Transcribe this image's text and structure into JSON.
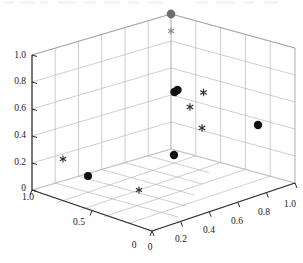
{
  "chart_data": {
    "type": "scatter",
    "title": "",
    "subtitle": "",
    "xlabel": "",
    "ylabel": "",
    "zlabel": "",
    "projection": "3d",
    "grid": true,
    "legend": "none",
    "axes": {
      "x": {
        "label": "",
        "lim": [
          1.0,
          0
        ],
        "ticks": [
          1.0,
          0.5,
          0
        ],
        "tick_labels": [
          "1.0",
          "0.5",
          "0"
        ],
        "direction": "left-front-to-back"
      },
      "y": {
        "label": "",
        "lim": [
          0,
          1.0
        ],
        "ticks": [
          0,
          0.2,
          0.4,
          0.6,
          0.8,
          1.0
        ],
        "tick_labels": [
          "0",
          "0.2",
          "0.4",
          "0.6",
          "0.8",
          "1.0"
        ],
        "direction": "right-front-to-back"
      },
      "z": {
        "label": "",
        "lim": [
          0,
          1.0
        ],
        "ticks": [
          0,
          0.2,
          0.4,
          0.6,
          0.8,
          1.0
        ],
        "tick_labels": [
          "0",
          "0.2",
          "0.4",
          "0.6",
          "0.8",
          "1.0"
        ],
        "direction": "vertical-left"
      }
    },
    "series": [
      {
        "name": "circles",
        "marker": "filled-circle",
        "color": "#111111",
        "points": [
          {
            "px": 174.5,
            "py": 92.0,
            "r": 4.2,
            "color": "#111111"
          },
          {
            "px": 177.5,
            "py": 90.0,
            "r": 4.2,
            "color": "#111111"
          },
          {
            "px": 258.0,
            "py": 125.0,
            "r": 4.2,
            "color": "#111111"
          },
          {
            "px": 174.0,
            "py": 155.0,
            "r": 4.2,
            "color": "#111111"
          },
          {
            "px": 88.0,
            "py": 176.0,
            "r": 4.0,
            "color": "#111111"
          },
          {
            "px": 171.0,
            "py": 14.0,
            "r": 4.4,
            "color": "#6e6e6e"
          }
        ]
      },
      {
        "name": "stars",
        "marker": "asterisk",
        "color": "#3a3a3a",
        "points": [
          {
            "px": 171.0,
            "py": 31.0,
            "r": 3.4,
            "color": "#8d8d8d"
          },
          {
            "px": 203.5,
            "py": 92.5,
            "r": 3.8,
            "color": "#2e2e2e"
          },
          {
            "px": 190.0,
            "py": 107.0,
            "r": 3.8,
            "color": "#2e2e2e"
          },
          {
            "px": 202.0,
            "py": 128.0,
            "r": 3.8,
            "color": "#2e2e2e"
          },
          {
            "px": 63.0,
            "py": 159.0,
            "r": 3.6,
            "color": "#2e2e2e"
          },
          {
            "px": 139.0,
            "py": 190.0,
            "r": 3.6,
            "color": "#2e2e2e"
          }
        ]
      }
    ]
  },
  "axis_labels": {
    "z": [
      {
        "text": "1.0",
        "x": 26,
        "y": 58
      },
      {
        "text": "0.8",
        "x": 26,
        "y": 84
      },
      {
        "text": "0.6",
        "x": 26,
        "y": 111
      },
      {
        "text": "0.4",
        "x": 26,
        "y": 138
      },
      {
        "text": "0.2",
        "x": 26,
        "y": 165
      },
      {
        "text": "0",
        "x": 26,
        "y": 191
      }
    ],
    "x": [
      {
        "text": "1.0",
        "x": 28,
        "y": 200
      },
      {
        "text": "0.5",
        "x": 79,
        "y": 225
      },
      {
        "text": "0",
        "x": 134,
        "y": 248
      }
    ],
    "y": [
      {
        "text": "0",
        "x": 150,
        "y": 250
      },
      {
        "text": "0.2",
        "x": 181,
        "y": 242
      },
      {
        "text": "0.4",
        "x": 209,
        "y": 233
      },
      {
        "text": "0.6",
        "x": 237,
        "y": 224
      },
      {
        "text": "0.8",
        "x": 264,
        "y": 215
      },
      {
        "text": "1.0",
        "x": 290,
        "y": 207
      }
    ]
  },
  "colors": {
    "background": "#ffffff",
    "grid": "#b9b9b9",
    "pane_edge": "#9a9a9a",
    "axis": "#2b2b2b",
    "marker_dark": "#111111",
    "marker_gray": "#6e6e6e",
    "marker_star": "#3a3a3a",
    "text": "#1a1a1a"
  }
}
